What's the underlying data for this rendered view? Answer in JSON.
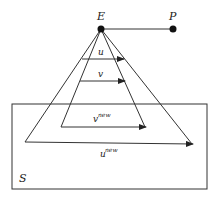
{
  "diagram": {
    "points": {
      "E": {
        "label": "E"
      },
      "P": {
        "label": "P"
      }
    },
    "vectors": {
      "u": {
        "label": "u"
      },
      "v": {
        "label": "v"
      },
      "v_new": {
        "label": "v",
        "superscript": "new"
      },
      "u_new": {
        "label": "u",
        "superscript": "new"
      }
    },
    "region": {
      "label": "S"
    },
    "colors": {
      "stroke": "#333333",
      "text": "#222222",
      "background": "#ffffff"
    }
  }
}
